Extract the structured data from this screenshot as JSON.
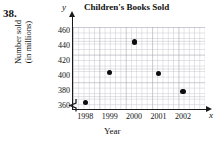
{
  "problem": {
    "number": "38."
  },
  "axis_letters": {
    "y": "y",
    "x": "x"
  },
  "chart_data": {
    "type": "scatter",
    "title": "Children's Books Sold",
    "xlabel": "Year",
    "ylabel_line1": "Number sold",
    "ylabel_line2": "(in millions)",
    "categories": [
      "1998",
      "1999",
      "2000",
      "2001",
      "2002"
    ],
    "x": [
      1998,
      1999,
      2000,
      2001,
      2002
    ],
    "values": [
      365,
      405,
      445,
      403,
      380
    ],
    "points": [
      {
        "year": "1998",
        "value": 365
      },
      {
        "year": "1999",
        "value": 405
      },
      {
        "year": "2000",
        "value": 445
      },
      {
        "year": "2001",
        "value": 403
      },
      {
        "year": "2002",
        "value": 380
      }
    ],
    "ylim": [
      355,
      465
    ],
    "xlim": [
      1997.5,
      2002.9
    ],
    "yticks": [
      360,
      380,
      400,
      420,
      440,
      460
    ],
    "ytick_labels": [
      "360",
      "380",
      "400",
      "420",
      "440",
      "460"
    ],
    "xtick_labels": [
      "1998",
      "1999",
      "2000",
      "2001",
      "2002"
    ],
    "grid": true,
    "y_axis_break": true,
    "legend": null,
    "marker_color": "#0d0d0d",
    "axis_color": "#1a1a1a",
    "grid_color": "#c8c8d0"
  }
}
